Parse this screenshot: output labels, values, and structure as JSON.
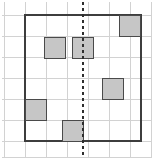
{
  "figure": {
    "canvas": {
      "width": 153,
      "height": 160
    },
    "colors": {
      "background": "#ffffff",
      "grid_line": "#d2d2d2",
      "border": "#3d3d3d",
      "square_fill": "#c6c6c6",
      "square_stroke": "#4a4a4a",
      "dashed_line": "#2e2e2e"
    },
    "grid": {
      "cell_size": 21,
      "origin_x": 4,
      "origin_y": 15,
      "columns": 7,
      "rows": 7,
      "vertical_line_positions": [
        4,
        25,
        46,
        67,
        88,
        109,
        130,
        151
      ],
      "horizontal_line_positions": [
        15,
        36,
        57,
        78,
        99,
        120,
        141,
        157
      ],
      "line_width": 1
    },
    "border_box": {
      "label": "outer-square-border",
      "x": 25,
      "y": 15,
      "width": 116,
      "height": 126,
      "stroke_width": 1.6
    },
    "symmetry_line": {
      "label": "vertical-line-of-symmetry",
      "orientation": "vertical",
      "x": 83,
      "y_start": 2,
      "y_end": 158,
      "dash_pattern": "3 3",
      "stroke_width": 1.8
    },
    "shaded_squares": [
      {
        "name": "shaded-square-top-right",
        "x": 119,
        "y": 15,
        "size": 22
      },
      {
        "name": "shaded-square-upper-left",
        "x": 44,
        "y": 37,
        "size": 22
      },
      {
        "name": "shaded-square-upper-center",
        "x": 72,
        "y": 37,
        "size": 22
      },
      {
        "name": "shaded-square-middle-right",
        "x": 102,
        "y": 78,
        "size": 22
      },
      {
        "name": "shaded-square-lower-left",
        "x": 25,
        "y": 99,
        "size": 22
      },
      {
        "name": "shaded-square-bottom-center",
        "x": 62,
        "y": 120,
        "size": 22
      }
    ],
    "counts": {
      "shaded_square_count": 6,
      "shaded_left_of_line": 3,
      "shaded_right_of_line": 2,
      "shaded_on_line": 1
    }
  }
}
